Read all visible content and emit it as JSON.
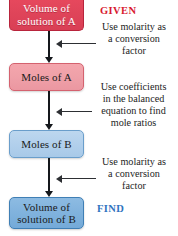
{
  "diagram": {
    "background_color": "#ffffff",
    "boxes": [
      {
        "id": "volume-a",
        "line1": "Volume of",
        "line2": "solution of A",
        "fill_color": "#e0455a",
        "border_color": "#b8243c",
        "text_color": "#ffffff"
      },
      {
        "id": "moles-a",
        "line1": "Moles of A",
        "line2": "",
        "fill_color": "#efa0a8",
        "border_color": "#d4626f",
        "text_color": "#1a1a1a"
      },
      {
        "id": "moles-b",
        "line1": "Moles of B",
        "line2": "",
        "fill_color": "#b2d0ec",
        "border_color": "#6a9ecb",
        "text_color": "#1a1a1a"
      },
      {
        "id": "volume-b",
        "line1": "Volume of",
        "line2": "solution of B",
        "fill_color": "#80b2dd",
        "border_color": "#3f7fb5",
        "text_color": "#1a1a1a"
      }
    ],
    "annotations": [
      {
        "id": "step-1",
        "line1": "Use molarity as",
        "line2": "a conversion",
        "line3": "factor",
        "line4": ""
      },
      {
        "id": "step-2",
        "line1": "Use coefficients",
        "line2": "in the balanced",
        "line3": "equation to find",
        "line4": "mole ratios"
      },
      {
        "id": "step-3",
        "line1": "Use molarity as",
        "line2": "a conversion",
        "line3": "factor",
        "line4": ""
      }
    ],
    "tags": {
      "given": "GIVEN",
      "given_color": "#d8192f",
      "find": "FIND",
      "find_color": "#2f74c0"
    }
  }
}
